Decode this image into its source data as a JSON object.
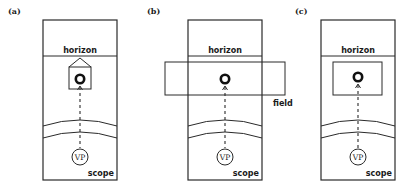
{
  "figure": {
    "panels": [
      {
        "id": "a",
        "panel_label": "(a)",
        "horizon_label": "horizon",
        "scope_label": "scope",
        "vp_label": "VP",
        "field_shape": "house"
      },
      {
        "id": "b",
        "panel_label": "(b)",
        "horizon_label": "horizon",
        "scope_label": "scope",
        "vp_label": "VP",
        "field_label": "field",
        "field_shape": "wide-rectangle"
      },
      {
        "id": "c",
        "panel_label": "(c)",
        "horizon_label": "horizon",
        "scope_label": "scope",
        "vp_label": "VP",
        "field_shape": "inner-rectangle"
      }
    ],
    "icons": {
      "target": "ring-target-icon",
      "viewpoint": "vp-circle-icon"
    },
    "colors": {
      "stroke": "#2a2a2a",
      "background": "#ffffff"
    }
  }
}
